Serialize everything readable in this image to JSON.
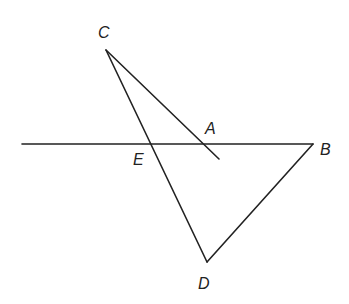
{
  "diagram": {
    "points": {
      "A": {
        "label": "A"
      },
      "B": {
        "label": "B"
      },
      "C": {
        "label": "C"
      },
      "D": {
        "label": "D"
      },
      "E": {
        "label": "E"
      }
    },
    "segments": [
      {
        "name": "line-through-E-A-B",
        "from": "left",
        "to": "B"
      },
      {
        "name": "segment-CD",
        "from": "C",
        "to": "D"
      },
      {
        "name": "segment-DB",
        "from": "D",
        "to": "B"
      },
      {
        "name": "segment-CA",
        "from": "C",
        "to": "A"
      }
    ],
    "colors": {
      "stroke": "#222222",
      "background": "#ffffff"
    }
  }
}
